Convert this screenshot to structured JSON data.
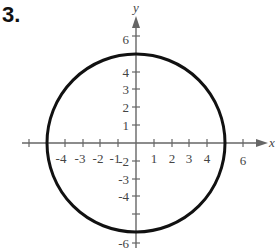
{
  "problem_number": "3.",
  "axes": {
    "x_label": "x",
    "y_label": "y",
    "x_tick_labels": [
      "-4",
      "-3",
      "-2",
      "-1",
      "1",
      "2",
      "3",
      "4",
      "6"
    ],
    "y_tick_labels": [
      "6",
      "4",
      "3",
      "2",
      "1",
      "-2",
      "-3",
      "-4",
      "-6"
    ]
  },
  "graph": {
    "shape": "circle",
    "center": [
      0,
      0
    ],
    "radius": 5,
    "stroke_color": "#111111",
    "axis_color": "#666666"
  }
}
